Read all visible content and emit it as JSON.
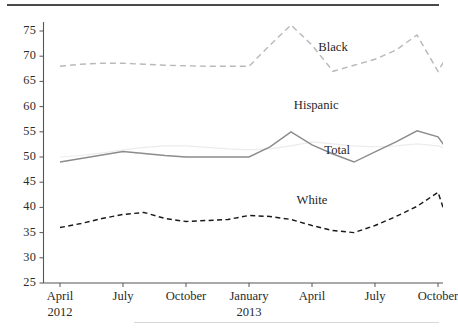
{
  "chart_data": {
    "type": "line",
    "title": "",
    "xlabel": "",
    "ylabel": "",
    "ylim": [
      25,
      75
    ],
    "yticks": [
      25,
      30,
      35,
      40,
      45,
      50,
      55,
      60,
      65,
      70,
      75
    ],
    "grid": false,
    "legend_position": "inline-labels",
    "x": [
      "April 2012",
      "May 2012",
      "June 2012",
      "July 2012",
      "August 2012",
      "September 2012",
      "October 2012",
      "November 2012",
      "December 2012",
      "January 2013",
      "February 2013",
      "March 2013",
      "April 2013",
      "May 2013",
      "June 2013",
      "July 2013",
      "August 2013",
      "September 2013",
      "October 2013",
      "November 2013"
    ],
    "xticks": [
      {
        "label": "April",
        "year": "2012",
        "index": 0
      },
      {
        "label": "July",
        "year": "",
        "index": 3
      },
      {
        "label": "October",
        "year": "",
        "index": 6
      },
      {
        "label": "January",
        "year": "2013",
        "index": 9
      },
      {
        "label": "April",
        "year": "",
        "index": 12
      },
      {
        "label": "July",
        "year": "",
        "index": 15
      },
      {
        "label": "October",
        "year": "",
        "index": 18
      }
    ],
    "series": [
      {
        "name": "Black",
        "color": "#b9b9b9",
        "style": "dashed",
        "label_x_index": 13.0,
        "label_y": 71.6,
        "values": [
          68,
          68.4,
          68.6,
          68.6,
          68.4,
          68.2,
          68.1,
          68.0,
          68.0,
          68.0,
          72.2,
          76.2,
          72.2,
          67.0,
          68.2,
          69.4,
          71.2,
          74.2,
          67.0,
          74.0
        ]
      },
      {
        "name": "Hispanic",
        "color": "#ececec",
        "style": "solid",
        "label_x_index": 12.2,
        "label_y": 60.2,
        "values": [
          50.0,
          50.3,
          50.8,
          51.4,
          51.9,
          52.2,
          52.2,
          51.9,
          51.6,
          51.4,
          51.6,
          52.2,
          53.0,
          52.6,
          52.2,
          52.0,
          52.2,
          52.6,
          52.2,
          51.0
        ]
      },
      {
        "name": "Total",
        "color": "#8c8c8c",
        "style": "solid",
        "label_x_index": 13.2,
        "label_y": 51.2,
        "values": [
          49.0,
          49.7,
          50.4,
          51.1,
          50.7,
          50.3,
          50.0,
          50.0,
          50.0,
          50.0,
          52.0,
          55.0,
          52.4,
          50.6,
          49.0,
          51.0,
          53.0,
          55.2,
          54.0,
          48.2
        ]
      },
      {
        "name": "White",
        "color": "#1a1a1a",
        "style": "dashed",
        "label_x_index": 12.0,
        "label_y": 41.2,
        "values": [
          36.0,
          36.8,
          37.8,
          38.6,
          39.0,
          37.8,
          37.2,
          37.4,
          37.6,
          38.4,
          38.2,
          37.6,
          36.4,
          35.4,
          35.0,
          36.4,
          38.2,
          40.2,
          43.0,
          30.5
        ]
      }
    ]
  },
  "axis": {
    "y_tick_labels": [
      "75",
      "70",
      "65",
      "60",
      "55",
      "50",
      "45",
      "40",
      "35",
      "30",
      "25"
    ],
    "x_tick_labels": [
      "April",
      "July",
      "October",
      "January",
      "April",
      "July",
      "October"
    ],
    "x_year_labels": [
      "2012",
      "",
      "",
      "2013",
      "",
      "",
      ""
    ]
  },
  "labels": {
    "black": "Black",
    "hispanic": "Hispanic",
    "total": "Total",
    "white": "White"
  }
}
